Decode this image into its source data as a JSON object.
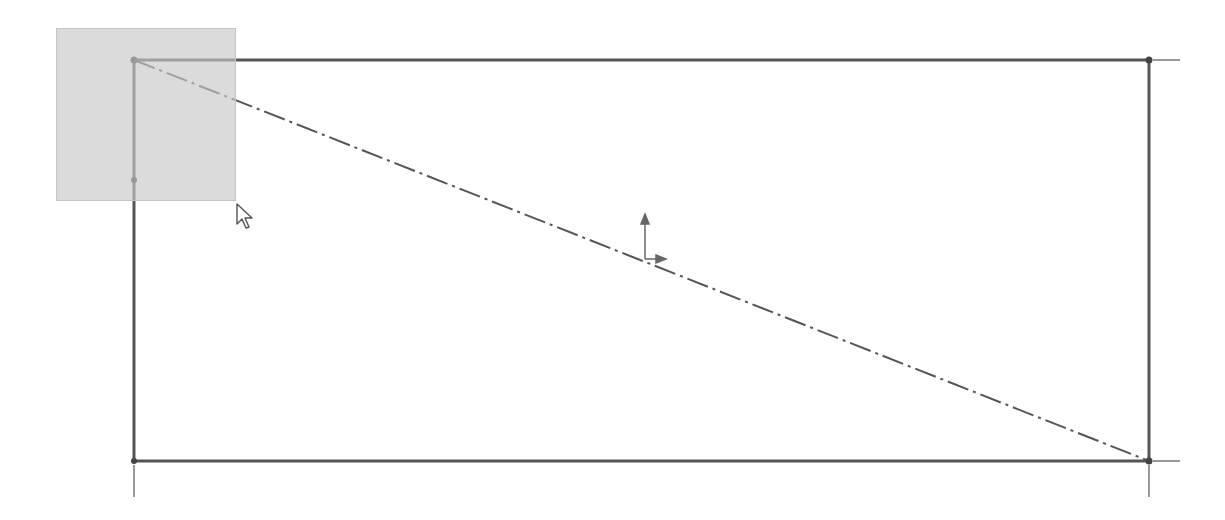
{
  "viewport": {
    "width": 1225,
    "height": 520,
    "background": "#ffffff"
  },
  "sketch": {
    "line_color": "#555555",
    "extension_color": "#777777",
    "rectangle": {
      "top_left": [
        134,
        60
      ],
      "top_right": [
        1149,
        60
      ],
      "bottom_right": [
        1149,
        461
      ],
      "bottom_left": [
        134,
        461
      ]
    },
    "left_edge_midpoint": [
      134,
      180
    ],
    "centerline": {
      "from": [
        134,
        60
      ],
      "to": [
        1149,
        461
      ],
      "style": "dash-dot"
    },
    "extension_lines": [
      {
        "from": [
          1153,
          60
        ],
        "to": [
          1180,
          60
        ]
      },
      {
        "from": [
          1153,
          461
        ],
        "to": [
          1180,
          461
        ]
      },
      {
        "from": [
          1149,
          465
        ],
        "to": [
          1149,
          497
        ]
      },
      {
        "from": [
          134,
          465
        ],
        "to": [
          134,
          497
        ]
      }
    ]
  },
  "origin_marker": {
    "position": [
      645,
      259
    ],
    "color": "#666666"
  },
  "selection_box": {
    "x": 56,
    "y": 28,
    "width": 180,
    "height": 173,
    "fill": "#d4d4d4"
  },
  "mouse_cursor": {
    "position": [
      236,
      203
    ],
    "icon": "arrow-pointer-icon"
  }
}
